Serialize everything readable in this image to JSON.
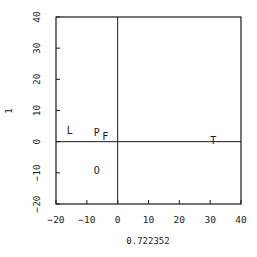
{
  "chart_data": {
    "type": "scatter",
    "title": "",
    "xlabel": "0.722352",
    "ylabel": "1",
    "xlim": [
      -20,
      40
    ],
    "ylim": [
      -20,
      40
    ],
    "xticks": [
      -20,
      -10,
      0,
      10,
      20,
      30,
      40
    ],
    "yticks": [
      -20,
      -10,
      0,
      10,
      20,
      30,
      40
    ],
    "grid": false,
    "zero_lines": true,
    "legend": null,
    "points": [
      {
        "label": "L",
        "x": -15.5,
        "y": 3.5
      },
      {
        "label": "P",
        "x": -6.8,
        "y": 3.0
      },
      {
        "label": "F",
        "x": -4.0,
        "y": 1.5
      },
      {
        "label": "O",
        "x": -6.8,
        "y": -9.4
      },
      {
        "label": "T",
        "x": 31.0,
        "y": 0.3
      }
    ]
  },
  "colors": {
    "ink": "#1a1a1a",
    "background": "#ffffff"
  }
}
